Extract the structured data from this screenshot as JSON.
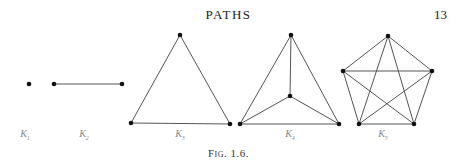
{
  "header": {
    "running_head": "PATHS",
    "page_number": "13"
  },
  "figure": {
    "caption": "Fig. 1.6.",
    "edge_color": "#555555",
    "vertex_color": "#111111",
    "graphs": [
      {
        "name": "K1",
        "label_base": "K",
        "label_sub": "1",
        "vertices": [
          [
            29,
            84
          ]
        ],
        "edges": []
      },
      {
        "name": "K2",
        "label_base": "K",
        "label_sub": "2",
        "vertices": [
          [
            54,
            84
          ],
          [
            122,
            84
          ]
        ],
        "edges": [
          [
            0,
            1
          ]
        ]
      },
      {
        "name": "K3",
        "label_base": "K",
        "label_sub": "3",
        "vertices": [
          [
            180,
            35
          ],
          [
            131,
            123
          ],
          [
            230,
            124
          ]
        ],
        "edges": [
          [
            0,
            1
          ],
          [
            0,
            2
          ],
          [
            1,
            2
          ]
        ]
      },
      {
        "name": "K4",
        "label_base": "K",
        "label_sub": "4",
        "vertices": [
          [
            291,
            35
          ],
          [
            290,
            96
          ],
          [
            240,
            124
          ],
          [
            339,
            124
          ]
        ],
        "edges": [
          [
            0,
            1
          ],
          [
            0,
            2
          ],
          [
            0,
            3
          ],
          [
            1,
            2
          ],
          [
            1,
            3
          ],
          [
            2,
            3
          ]
        ]
      },
      {
        "name": "K5",
        "label_base": "K",
        "label_sub": "5",
        "vertices": [
          [
            388,
            36
          ],
          [
            343,
            71
          ],
          [
            432,
            71
          ],
          [
            359,
            124
          ],
          [
            414,
            124
          ]
        ],
        "edges": [
          [
            0,
            1
          ],
          [
            0,
            2
          ],
          [
            0,
            3
          ],
          [
            0,
            4
          ],
          [
            1,
            2
          ],
          [
            1,
            3
          ],
          [
            1,
            4
          ],
          [
            2,
            3
          ],
          [
            2,
            4
          ],
          [
            3,
            4
          ]
        ]
      }
    ],
    "labels": [
      {
        "text": "K",
        "sub": "1",
        "x": 25,
        "y": 128
      },
      {
        "text": "K",
        "sub": "2",
        "x": 84,
        "y": 128
      },
      {
        "text": "K",
        "sub": "3",
        "x": 180,
        "y": 128
      },
      {
        "text": "K",
        "sub": "4",
        "x": 290,
        "y": 128
      },
      {
        "text": "K",
        "sub": "5",
        "x": 383,
        "y": 128
      }
    ]
  }
}
